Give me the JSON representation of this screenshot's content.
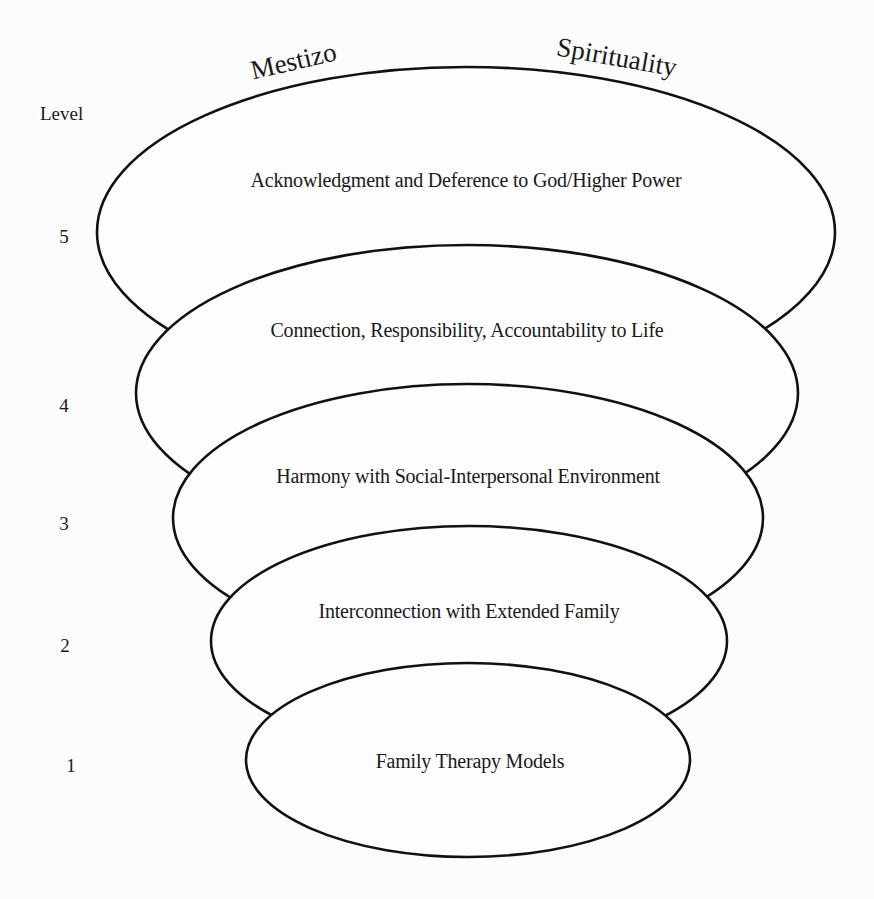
{
  "title": {
    "left_word": "Mestizo",
    "right_word": "Spirituality"
  },
  "axis": {
    "label": "Level"
  },
  "levels": [
    {
      "number": "5",
      "label": "Acknowledgment and Deference to God/Higher Power"
    },
    {
      "number": "4",
      "label": "Connection, Responsibility, Accountability to Life"
    },
    {
      "number": "3",
      "label": "Harmony with Social-Interpersonal Environment"
    },
    {
      "number": "2",
      "label": "Interconnection with Extended Family"
    },
    {
      "number": "1",
      "label": "Family Therapy Models"
    }
  ],
  "colors": {
    "stroke": "#111111",
    "background": "#fcfcfc",
    "text": "#1a1a1a"
  }
}
